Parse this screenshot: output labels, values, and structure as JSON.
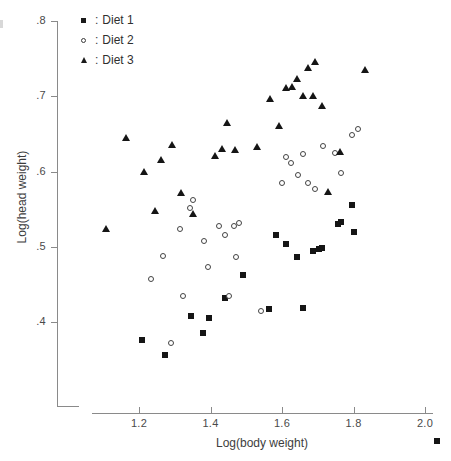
{
  "figure": {
    "width": 451,
    "height": 461,
    "background": "#ffffff"
  },
  "legend": {
    "position": "top-left-inside",
    "separator": ":",
    "entries": [
      {
        "label": "Diet 1",
        "marker": "filled-square",
        "color": "#1a1a1a"
      },
      {
        "label": "Diet 2",
        "marker": "open-circle",
        "color": "#3a3a3a"
      },
      {
        "label": "Diet 3",
        "marker": "filled-triangle",
        "color": "#1a1a1a"
      }
    ]
  },
  "axes": {
    "x": {
      "title": "Log(body weight)",
      "ticks": [
        "1.2",
        "1.4",
        "1.6",
        "1.8",
        "2.0"
      ],
      "tick_values": [
        1.2,
        1.4,
        1.6,
        1.8,
        2.0
      ],
      "pixel_positions": [
        139,
        210.5,
        282,
        353.5,
        425
      ],
      "range": [
        1.06,
        2.06
      ]
    },
    "y": {
      "title": "Log(head weight)",
      "ticks": [
        ".4",
        ".5",
        ".6",
        ".7",
        ".8"
      ],
      "tick_values": [
        0.4,
        0.5,
        0.6,
        0.7,
        0.8
      ],
      "pixel_positions": [
        322,
        246.75,
        171.5,
        96.25,
        21
      ],
      "range": [
        0.355,
        0.812
      ]
    },
    "grid": "off",
    "axis_color": "#8a8a8a"
  },
  "chart_data": {
    "type": "scatter",
    "title": "",
    "xlabel": "Log(body weight)",
    "ylabel": "Log(head weight)",
    "xlim": [
      1.06,
      2.06
    ],
    "ylim": [
      0.355,
      0.812
    ],
    "grid": false,
    "legend_position": "top-left",
    "series": [
      {
        "name": "Diet 1",
        "marker": "filled-square",
        "color": "#151515",
        "points": [
          [
            1.207,
            0.376
          ],
          [
            1.272,
            0.356
          ],
          [
            1.345,
            0.408
          ],
          [
            1.378,
            0.386
          ],
          [
            1.395,
            0.405
          ],
          [
            1.441,
            0.432
          ],
          [
            1.492,
            0.462
          ],
          [
            1.563,
            0.417
          ],
          [
            1.582,
            0.516
          ],
          [
            1.612,
            0.503
          ],
          [
            1.642,
            0.487
          ],
          [
            1.658,
            0.418
          ],
          [
            1.688,
            0.494
          ],
          [
            1.703,
            0.497
          ],
          [
            1.712,
            0.499
          ],
          [
            1.757,
            0.53
          ],
          [
            1.766,
            0.533
          ],
          [
            1.797,
            0.556
          ],
          [
            1.801,
            0.52
          ]
        ]
      },
      {
        "name": "Diet 2",
        "marker": "open-circle",
        "color": "#434343",
        "points": [
          [
            1.234,
            0.457
          ],
          [
            1.268,
            0.488
          ],
          [
            1.289,
            0.372
          ],
          [
            1.316,
            0.524
          ],
          [
            1.323,
            0.434
          ],
          [
            1.344,
            0.551
          ],
          [
            1.352,
            0.562
          ],
          [
            1.381,
            0.508
          ],
          [
            1.394,
            0.473
          ],
          [
            1.424,
            0.527
          ],
          [
            1.441,
            0.516
          ],
          [
            1.452,
            0.434
          ],
          [
            1.466,
            0.527
          ],
          [
            1.471,
            0.487
          ],
          [
            1.48,
            0.531
          ],
          [
            1.541,
            0.414
          ],
          [
            1.601,
            0.585
          ],
          [
            1.612,
            0.619
          ],
          [
            1.624,
            0.611
          ],
          [
            1.645,
            0.596
          ],
          [
            1.659,
            0.623
          ],
          [
            1.672,
            0.585
          ],
          [
            1.693,
            0.577
          ],
          [
            1.716,
            0.634
          ],
          [
            1.747,
            0.624
          ],
          [
            1.766,
            0.598
          ],
          [
            1.797,
            0.648
          ],
          [
            1.812,
            0.656
          ]
        ]
      },
      {
        "name": "Diet 3",
        "marker": "filled-triangle",
        "color": "#151515",
        "points": [
          [
            1.108,
            0.523
          ],
          [
            1.163,
            0.644
          ],
          [
            1.214,
            0.6
          ],
          [
            1.246,
            0.548
          ],
          [
            1.261,
            0.615
          ],
          [
            1.292,
            0.635
          ],
          [
            1.318,
            0.571
          ],
          [
            1.352,
            0.543
          ],
          [
            1.412,
            0.62
          ],
          [
            1.432,
            0.63
          ],
          [
            1.447,
            0.664
          ],
          [
            1.468,
            0.629
          ],
          [
            1.531,
            0.632
          ],
          [
            1.566,
            0.697
          ],
          [
            1.592,
            0.66
          ],
          [
            1.612,
            0.711
          ],
          [
            1.628,
            0.712
          ],
          [
            1.642,
            0.723
          ],
          [
            1.658,
            0.701
          ],
          [
            1.672,
            0.738
          ],
          [
            1.686,
            0.7
          ],
          [
            1.692,
            0.745
          ],
          [
            1.712,
            0.687
          ],
          [
            1.728,
            0.573
          ],
          [
            1.762,
            0.626
          ],
          [
            1.832,
            0.735
          ]
        ]
      }
    ]
  }
}
